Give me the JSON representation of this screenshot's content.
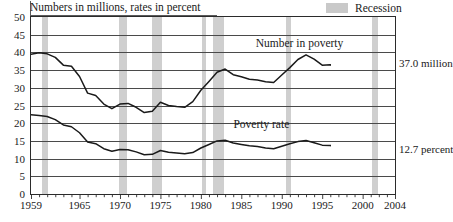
{
  "title": "Numbers in millions, rates in percent",
  "legend": {
    "swatch_color": "#cfcfcf",
    "label": "Recession"
  },
  "annotations": {
    "series_upper_label": "Number in poverty",
    "series_lower_label": "Poverty rate",
    "end_value_upper": "37.0 million",
    "end_value_lower": "12.7 percent"
  },
  "chart_data": {
    "type": "line",
    "title": "Numbers in millions, rates in percent",
    "xlabel": "",
    "ylabel": "",
    "xlim": [
      1959,
      2004
    ],
    "ylim": [
      0,
      50
    ],
    "grid": true,
    "legend_position": "top-right",
    "ytick_labels": [
      "0",
      "5",
      "10",
      "15",
      "20",
      "25",
      "30",
      "35",
      "40",
      "45",
      "50"
    ],
    "yticks": [
      0,
      5,
      10,
      15,
      20,
      25,
      30,
      35,
      40,
      45,
      50
    ],
    "xtick_labels": [
      "1959",
      "1965",
      "1970",
      "1975",
      "1980",
      "1985",
      "1990",
      "1995",
      "2000",
      "2004"
    ],
    "xticks": [
      1959,
      1965,
      1970,
      1975,
      1980,
      1985,
      1990,
      1995,
      2000,
      2004
    ],
    "x": [
      1959,
      1960,
      1961,
      1962,
      1963,
      1964,
      1965,
      1966,
      1967,
      1968,
      1969,
      1970,
      1971,
      1972,
      1973,
      1974,
      1975,
      1976,
      1977,
      1978,
      1979,
      1980,
      1981,
      1982,
      1983,
      1984,
      1985,
      1986,
      1987,
      1988,
      1989,
      1990,
      1991,
      1992,
      1993,
      1994,
      1995,
      1996,
      1997,
      1998,
      1999,
      2000,
      2001,
      2002,
      2003,
      2004
    ],
    "series": [
      {
        "name": "Number in poverty",
        "units": "millions",
        "values": [
          39.5,
          39.9,
          39.6,
          38.6,
          36.4,
          36.1,
          33.2,
          28.5,
          27.8,
          25.4,
          24.1,
          25.4,
          25.6,
          24.5,
          23.0,
          23.4,
          25.9,
          25.0,
          24.7,
          24.5,
          26.1,
          29.3,
          31.8,
          34.4,
          35.3,
          33.7,
          33.1,
          32.4,
          32.2,
          31.7,
          31.5,
          33.6,
          35.7,
          38.0,
          39.3,
          38.1,
          36.4,
          36.5,
          35.6,
          34.5,
          32.8,
          31.6,
          32.9,
          34.6,
          35.9,
          37.0
        ],
        "end_label": "37.0 million"
      },
      {
        "name": "Poverty rate",
        "units": "percent",
        "values": [
          22.4,
          22.2,
          21.9,
          21.0,
          19.5,
          19.0,
          17.3,
          14.7,
          14.2,
          12.8,
          12.1,
          12.6,
          12.5,
          11.9,
          11.1,
          11.2,
          12.3,
          11.8,
          11.6,
          11.4,
          11.7,
          13.0,
          14.0,
          15.0,
          15.2,
          14.4,
          14.0,
          13.6,
          13.4,
          13.0,
          12.8,
          13.5,
          14.2,
          14.8,
          15.1,
          14.5,
          13.8,
          13.7,
          13.3,
          12.7,
          11.9,
          11.3,
          11.7,
          12.1,
          12.5,
          12.7
        ],
        "end_label": "12.7 percent"
      }
    ],
    "recessions": [
      {
        "start": 1960.3,
        "end": 1961.1
      },
      {
        "start": 1969.9,
        "end": 1970.9
      },
      {
        "start": 1973.9,
        "end": 1975.2
      },
      {
        "start": 1980.1,
        "end": 1980.6
      },
      {
        "start": 1981.5,
        "end": 1982.9
      },
      {
        "start": 1990.5,
        "end": 1991.2
      },
      {
        "start": 2001.2,
        "end": 2001.9
      }
    ]
  }
}
